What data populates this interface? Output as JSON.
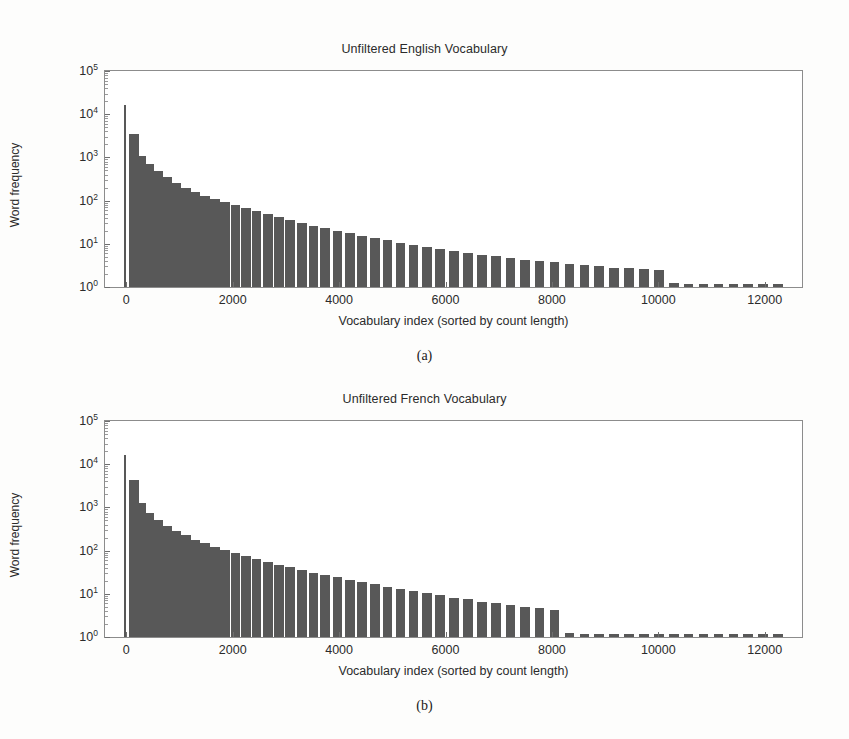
{
  "figure": {
    "panels": [
      {
        "id": "a",
        "subcaption": "(a)",
        "title": "Unfiltered English Vocabulary"
      },
      {
        "id": "b",
        "subcaption": "(b)",
        "title": "Unfiltered French Vocabulary"
      }
    ]
  },
  "chart_data": [
    {
      "type": "bar",
      "title": "Unfiltered English Vocabulary",
      "xlabel": "Vocabulary index (sorted by count length)",
      "ylabel": "Word frequency",
      "yscale": "log",
      "ylim": [
        1,
        100000
      ],
      "ytick_labels": [
        "10^0",
        "10^1",
        "10^2",
        "10^3",
        "10^4",
        "10^5"
      ],
      "ytick_values": [
        1,
        10,
        100,
        1000,
        10000,
        100000
      ],
      "xlim": [
        -400,
        12700
      ],
      "xtick_labels": [
        "0",
        "2000",
        "4000",
        "6000",
        "8000",
        "10000",
        "12000"
      ],
      "xtick_values": [
        0,
        2000,
        4000,
        6000,
        8000,
        10000,
        12000
      ],
      "grid": false,
      "legend": null,
      "bar_color": "#585858",
      "bin_width": 220,
      "x": [
        60,
        160,
        300,
        460,
        620,
        790,
        960,
        1140,
        1320,
        1500,
        1690,
        1880,
        2070,
        2270,
        2470,
        2680,
        2890,
        3100,
        3320,
        3540,
        3760,
        3990,
        4220,
        4450,
        4690,
        4930,
        5170,
        5420,
        5670,
        5920,
        6180,
        6440,
        6700,
        6970,
        7240,
        7510,
        7790,
        8070,
        8350,
        8630,
        8910,
        9190,
        9470,
        9750,
        10030,
        10310,
        10590,
        10870,
        11150,
        11430,
        11710,
        11990,
        12270
      ],
      "values": [
        16000,
        3500,
        1100,
        700,
        480,
        350,
        260,
        200,
        160,
        130,
        110,
        92,
        78,
        66,
        56,
        48,
        41,
        35,
        30,
        26,
        23,
        20,
        17.5,
        15.5,
        13.5,
        12,
        10.5,
        9.5,
        8.5,
        7.6,
        6.8,
        6.2,
        5.6,
        5.1,
        4.7,
        4.3,
        4.0,
        3.7,
        3.4,
        3.2,
        3.0,
        2.8,
        2.7,
        2.6,
        2.5,
        1.25,
        1.2,
        1.2,
        1.2,
        1.2,
        1.2,
        1.2,
        1.2
      ]
    },
    {
      "type": "bar",
      "title": "Unfiltered French Vocabulary",
      "xlabel": "Vocabulary index (sorted by count length)",
      "ylabel": "Word frequency",
      "yscale": "log",
      "ylim": [
        1,
        100000
      ],
      "ytick_labels": [
        "10^0",
        "10^1",
        "10^2",
        "10^3",
        "10^4",
        "10^5"
      ],
      "ytick_values": [
        1,
        10,
        100,
        1000,
        10000,
        100000
      ],
      "xlim": [
        -400,
        12700
      ],
      "xtick_labels": [
        "0",
        "2000",
        "4000",
        "6000",
        "8000",
        "10000",
        "12000"
      ],
      "xtick_values": [
        0,
        2000,
        4000,
        6000,
        8000,
        10000,
        12000
      ],
      "grid": false,
      "legend": null,
      "bar_color": "#585858",
      "bin_width": 220,
      "x": [
        60,
        160,
        300,
        460,
        620,
        790,
        960,
        1140,
        1320,
        1500,
        1690,
        1880,
        2070,
        2270,
        2470,
        2680,
        2890,
        3100,
        3320,
        3540,
        3760,
        3990,
        4220,
        4450,
        4690,
        4930,
        5170,
        5420,
        5670,
        5920,
        6180,
        6440,
        6700,
        6970,
        7240,
        7510,
        7790,
        8070,
        8350,
        8630,
        8910,
        9190,
        9470,
        9750,
        10030,
        10310,
        10590,
        10870,
        11150,
        11430,
        11710,
        11990,
        12270
      ],
      "values": [
        16500,
        4200,
        1250,
        760,
        520,
        380,
        290,
        225,
        180,
        148,
        124,
        104,
        88,
        75,
        64,
        55,
        47,
        41,
        36,
        31,
        27,
        24,
        21,
        18.5,
        16.5,
        14.5,
        13,
        11.5,
        10.2,
        9.2,
        8.2,
        7.4,
        6.6,
        6.0,
        5.5,
        5.0,
        4.6,
        4.2,
        1.25,
        1.2,
        1.2,
        1.2,
        1.2,
        1.2,
        1.2,
        1.2,
        1.2,
        1.2,
        1.2,
        1.2,
        1.2,
        1.2,
        1.2
      ]
    }
  ]
}
